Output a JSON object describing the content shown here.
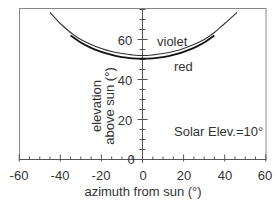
{
  "chart_data": {
    "type": "line",
    "title": "",
    "xlabel": "azimuth from sun (°)",
    "ylabel": [
      "elevation",
      "above sun (°)"
    ],
    "xlim": [
      -60,
      60
    ],
    "ylim": [
      0,
      76
    ],
    "x_ticks": [
      "-60",
      "-40",
      "-20",
      "0",
      "20",
      "40",
      "60"
    ],
    "y_ticks": [
      "0",
      "20",
      "40",
      "60"
    ],
    "grid": false,
    "legend_position": "inline labels",
    "annotation": "Solar Elev.=10°",
    "series": [
      {
        "name": "violet",
        "color": "#333333",
        "points": [
          [
            -45,
            73.5
          ],
          [
            -40,
            68
          ],
          [
            -35,
            63.5
          ],
          [
            -30,
            60
          ],
          [
            -25,
            57.5
          ],
          [
            -20,
            55.5
          ],
          [
            -15,
            54
          ],
          [
            -10,
            53
          ],
          [
            -5,
            52.3
          ],
          [
            0,
            52
          ],
          [
            5,
            52.3
          ],
          [
            10,
            53
          ],
          [
            15,
            54
          ],
          [
            20,
            55.5
          ],
          [
            25,
            57.5
          ],
          [
            30,
            60
          ],
          [
            35,
            63.5
          ],
          [
            40,
            68
          ],
          [
            46,
            73.5
          ]
        ]
      },
      {
        "name": "red",
        "color": "#222222",
        "points": [
          [
            -35,
            62
          ],
          [
            -30,
            58.5
          ],
          [
            -25,
            55.8
          ],
          [
            -20,
            53.8
          ],
          [
            -15,
            52.3
          ],
          [
            -10,
            51.2
          ],
          [
            -5,
            50.6
          ],
          [
            0,
            50.4
          ],
          [
            5,
            50.6
          ],
          [
            10,
            51.2
          ],
          [
            15,
            52.3
          ],
          [
            20,
            53.8
          ],
          [
            25,
            55.8
          ],
          [
            30,
            58.5
          ],
          [
            35,
            62
          ]
        ]
      }
    ]
  },
  "labels": {
    "violet": "violet",
    "red": "red",
    "annotation": "Solar Elev.=10°",
    "xlabel": "azimuth from sun (°)",
    "ylabel_line1": "elevation",
    "ylabel_line2": "above sun (°)",
    "x_ticks": [
      "-60",
      "-40",
      "-20",
      "0",
      "20",
      "40",
      "60"
    ],
    "y_ticks": [
      "0",
      "20",
      "40",
      "60"
    ]
  }
}
